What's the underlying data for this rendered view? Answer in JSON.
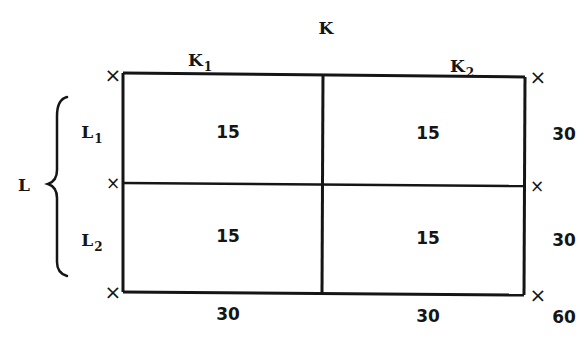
{
  "diagram": {
    "title": "K",
    "columns": [
      {
        "label": "K",
        "subscript": "1",
        "total": "30"
      },
      {
        "label": "K",
        "subscript": "2",
        "total": "30"
      }
    ],
    "row_group": {
      "label": "L"
    },
    "rows": [
      {
        "label": "L",
        "subscript": "1",
        "total": "30",
        "cells": [
          "15",
          "15"
        ]
      },
      {
        "label": "L",
        "subscript": "2",
        "total": "30",
        "cells": [
          "15",
          "15"
        ]
      }
    ],
    "grand_total": "60",
    "marker_glyph": "×",
    "colors": {
      "line": "#151515",
      "background": "#ffffff"
    }
  }
}
